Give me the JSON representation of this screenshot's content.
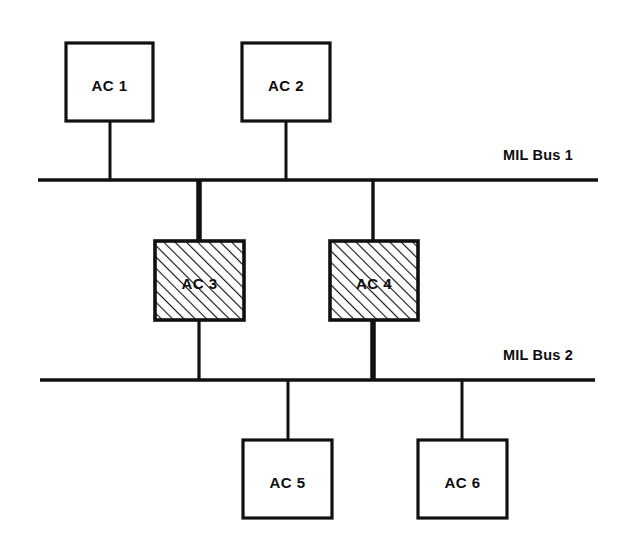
{
  "diagram": {
    "background_color": "#ffffff",
    "line_color": "#111111",
    "buses": [
      {
        "id": "mil-bus-1",
        "label": "MIL Bus 1",
        "y": 180,
        "x_start": 38,
        "x_end": 598,
        "thickness": 3.4,
        "label_x": 503,
        "label_y": 160
      },
      {
        "id": "mil-bus-2",
        "label": "MIL Bus 2",
        "y": 380,
        "x_start": 40,
        "x_end": 595,
        "thickness": 3.4,
        "label_x": 503,
        "label_y": 360
      }
    ],
    "nodes": [
      {
        "id": "ac-1",
        "label": "AC 1",
        "style": "plain",
        "x": 66,
        "y": 43,
        "w": 87,
        "h": 78,
        "label_x": 109.5,
        "label_y": 87
      },
      {
        "id": "ac-2",
        "label": "AC 2",
        "style": "plain",
        "x": 242,
        "y": 43,
        "w": 88,
        "h": 78,
        "label_x": 286,
        "label_y": 87
      },
      {
        "id": "ac-3",
        "label": "AC 3",
        "style": "hatched",
        "x": 155,
        "y": 241,
        "w": 89,
        "h": 79,
        "label_x": 199.5,
        "label_y": 285
      },
      {
        "id": "ac-4",
        "label": "AC 4",
        "style": "hatched",
        "x": 330,
        "y": 241,
        "w": 88,
        "h": 79,
        "label_x": 374,
        "label_y": 285
      },
      {
        "id": "ac-5",
        "label": "AC 5",
        "style": "plain",
        "x": 243,
        "y": 440,
        "w": 89,
        "h": 78,
        "label_x": 287.5,
        "label_y": 484
      },
      {
        "id": "ac-6",
        "label": "AC 6",
        "style": "plain",
        "x": 418,
        "y": 440,
        "w": 89,
        "h": 78,
        "label_x": 462.5,
        "label_y": 484
      }
    ],
    "connections": [
      {
        "id": "stub-ac1-bus1",
        "from": "ac-1",
        "to": "mil-bus-1",
        "x": 110,
        "y1": 121,
        "y2": 181,
        "thickness": 3
      },
      {
        "id": "stub-ac2-bus1",
        "from": "ac-2",
        "to": "mil-bus-1",
        "x": 286,
        "y1": 121,
        "y2": 181,
        "thickness": 3
      },
      {
        "id": "stub-bus1-ac3",
        "from": "mil-bus-1",
        "to": "ac-3",
        "x": 199,
        "y1": 179,
        "y2": 242,
        "thickness": 5.5
      },
      {
        "id": "stub-bus1-ac4",
        "from": "mil-bus-1",
        "to": "ac-4",
        "x": 373,
        "y1": 179,
        "y2": 242,
        "thickness": 3.4
      },
      {
        "id": "stub-ac3-bus2",
        "from": "ac-3",
        "to": "mil-bus-2",
        "x": 199,
        "y1": 319,
        "y2": 381,
        "thickness": 3.2
      },
      {
        "id": "stub-ac4-bus2",
        "from": "ac-4",
        "to": "mil-bus-2",
        "x": 373,
        "y1": 319,
        "y2": 381,
        "thickness": 5.5
      },
      {
        "id": "stub-bus2-ac5",
        "from": "mil-bus-2",
        "to": "ac-5",
        "x": 288,
        "y1": 379,
        "y2": 441,
        "thickness": 3
      },
      {
        "id": "stub-bus2-ac6",
        "from": "mil-bus-2",
        "to": "ac-6",
        "x": 462,
        "y1": 379,
        "y2": 441,
        "thickness": 3
      }
    ],
    "hatch": {
      "angle_description": "45-degree diagonal lines rising left to right",
      "spacing": 8,
      "stroke_width": 2.2,
      "color": "#111111"
    }
  }
}
